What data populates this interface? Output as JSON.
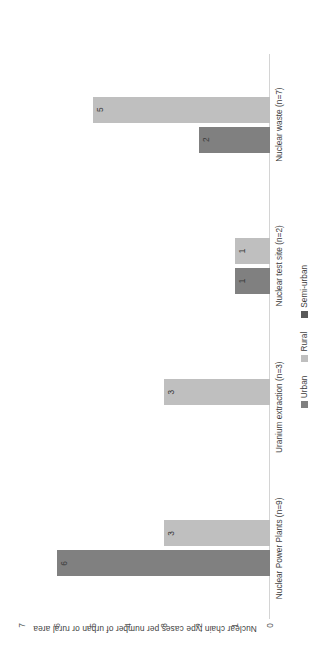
{
  "chart_data": {
    "type": "bar",
    "title": "",
    "subtitle": "",
    "xlabel": "",
    "ylabel": "Nuclear chain type cases per number of urban or rural area",
    "ylim": [
      0,
      7
    ],
    "yticks": [
      "0",
      "1",
      "2",
      "3",
      "4",
      "5",
      "6",
      "7"
    ],
    "grid": false,
    "orientation": "vertical-bars-rotated-90ccw",
    "legend_position": "bottom-center",
    "categories": [
      "Nuclear Power Plants (n=9)",
      "Uranium extraction (n=3)",
      "Nuclear test site (n=2)",
      "Nuclear waste (n=7)"
    ],
    "series": [
      {
        "name": "Urban",
        "color": "#808080",
        "values": [
          6,
          0,
          1,
          2
        ],
        "labels": [
          "6",
          "",
          "1",
          "2"
        ]
      },
      {
        "name": "Rural",
        "color": "#bfbfbf",
        "values": [
          3,
          3,
          1,
          5
        ],
        "labels": [
          "3",
          "3",
          "1",
          "5"
        ]
      },
      {
        "name": "Semi-urban",
        "color": "#595959",
        "values": [
          0,
          0,
          0,
          0
        ],
        "labels": [
          "",
          "",
          "",
          ""
        ]
      }
    ]
  },
  "axis": {
    "y_title": "Nuclear chain type cases per number of urban or rural area",
    "ticks": [
      "7",
      "6",
      "5",
      "4",
      "3",
      "2",
      "1",
      "0"
    ]
  },
  "legend": {
    "items": [
      {
        "label": "Urban",
        "color": "#808080"
      },
      {
        "label": "Rural",
        "color": "#bfbfbf"
      },
      {
        "label": "Semi-urban",
        "color": "#595959"
      }
    ]
  }
}
